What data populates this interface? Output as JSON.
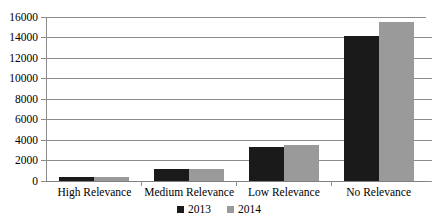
{
  "chart_data": {
    "type": "bar",
    "title": "",
    "subtitle": "",
    "xlabel": "",
    "ylabel": "",
    "categories": [
      "High Relevance",
      "Medium Relevance",
      "Low Relevance",
      "No Relevance"
    ],
    "series": [
      {
        "name": "2013",
        "color": "#1a1a1a",
        "values": [
          350,
          1200,
          3300,
          14100
        ]
      },
      {
        "name": "2014",
        "color": "#9a9a9a",
        "values": [
          380,
          1200,
          3550,
          15500
        ]
      }
    ],
    "ylim": [
      0,
      16000
    ],
    "ytick_step": 2000,
    "ytick_labels": [
      "16000",
      "14000",
      "12000",
      "10000",
      "8000",
      "6000",
      "4000",
      "2000",
      "0"
    ],
    "ytick_values": [
      16000,
      14000,
      12000,
      10000,
      8000,
      6000,
      4000,
      2000,
      0
    ],
    "grid": true,
    "grid_orientation": "horizontal",
    "legend_position": "bottom",
    "legend": [
      {
        "label": "2013",
        "color": "#1a1a1a"
      },
      {
        "label": "2014",
        "color": "#9a9a9a"
      }
    ],
    "background_color": "#ffffff",
    "axis_color": "#8c8c8c"
  }
}
